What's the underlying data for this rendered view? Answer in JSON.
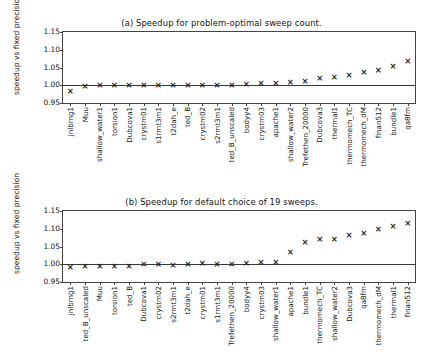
{
  "figure": {
    "width": 443,
    "height": 358,
    "background": "#ffffff",
    "marker_glyph": "x",
    "marker_color": "#1f1f1f",
    "axis_color": "#444444",
    "reference_line_value": 1.0
  },
  "chart_data": [
    {
      "type": "scatter",
      "panel": "a",
      "title": "(a) Speedup for problem-optimal sweep count.",
      "xlabel": "",
      "ylabel": "speedup vs fixed precision",
      "ylim": [
        0.95,
        1.15
      ],
      "yticks": [
        0.95,
        1.0,
        1.05,
        1.1,
        1.15
      ],
      "ytick_labels": [
        "0.95",
        "1.00",
        "1.05",
        "1.10",
        "1.15"
      ],
      "grid": false,
      "legend": "none",
      "reference_line": 1.0,
      "categories": [
        "jnlbrng1",
        "Muu",
        "shallow_water1",
        "torsion1",
        "Dubcova1",
        "crystm01",
        "s1rmt3m1",
        "t2dah_e",
        "ted_B",
        "crystm02",
        "s2rmt3m1",
        "ted_B_unscaled",
        "bodyy4",
        "crystm03",
        "apache1",
        "shallow_water2",
        "Trefethen_20000",
        "Dubcova3",
        "thermal1",
        "thermomech_TC",
        "thermomech_dM",
        "finan512",
        "bundle1",
        "qa8fm"
      ],
      "values": [
        0.983,
        0.996,
        0.998,
        0.999,
        0.999,
        1.0,
        1.0,
        1.0,
        1.0,
        1.0,
        1.0,
        1.0,
        1.002,
        1.004,
        1.005,
        1.007,
        1.01,
        1.019,
        1.023,
        1.027,
        1.036,
        1.042,
        1.052,
        1.066
      ]
    },
    {
      "type": "scatter",
      "panel": "b",
      "title": "(b) Speedup for default choice of 19 sweeps.",
      "xlabel": "",
      "ylabel": "speedup vs fixed precision",
      "ylim": [
        0.95,
        1.15
      ],
      "yticks": [
        0.95,
        1.0,
        1.05,
        1.1,
        1.15
      ],
      "ytick_labels": [
        "0.95",
        "1.00",
        "1.05",
        "1.10",
        "1.15"
      ],
      "grid": false,
      "legend": "none",
      "reference_line": 1.0,
      "categories": [
        "jnlbrng1",
        "ted_B_unscaled",
        "Muu",
        "torsion1",
        "ted_B",
        "Dubcova1",
        "crystm02",
        "s2rmt3m1",
        "t2dah_e",
        "crystm01",
        "s1rmt3m1",
        "Trefethen_20000",
        "bodyy4",
        "crystm03",
        "shallow_water1",
        "apache1",
        "bundle1",
        "thermomech_TC",
        "shallow_water2",
        "Dubcova3",
        "qa8fm",
        "thermomech_dM",
        "thermal1",
        "finan512"
      ],
      "values": [
        0.992,
        0.993,
        0.994,
        0.995,
        0.995,
        0.998,
        0.998,
        0.997,
        0.999,
        1.001,
        1.0,
        1.0,
        1.002,
        1.004,
        1.006,
        1.033,
        1.061,
        1.07,
        1.07,
        1.081,
        1.086,
        1.097,
        1.105,
        1.115
      ]
    }
  ]
}
